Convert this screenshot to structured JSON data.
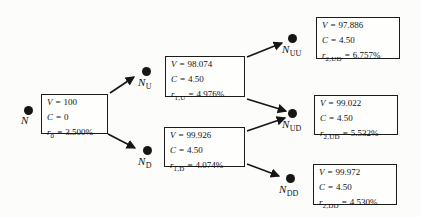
{
  "figure": {
    "eq": "=",
    "ink_color": "#161616",
    "background": "#fcfcfa"
  },
  "nodes": [
    {
      "id": "N",
      "label_main": "N",
      "label_sub": "",
      "box": {
        "rows": [
          {
            "var": "V",
            "sub": "",
            "value": "100"
          },
          {
            "var": "C",
            "sub": "",
            "value": "0"
          },
          {
            "var": "r",
            "sub": "0",
            "value": "3.500%"
          }
        ]
      }
    },
    {
      "id": "NU",
      "label_main": "N",
      "label_sub": "U",
      "box": {
        "rows": [
          {
            "var": "V",
            "sub": "",
            "value": "98.074"
          },
          {
            "var": "C",
            "sub": "",
            "value": "4.50"
          },
          {
            "var": "r",
            "sub": "1,U",
            "value": "4.976%"
          }
        ]
      }
    },
    {
      "id": "ND",
      "label_main": "N",
      "label_sub": "D",
      "box": {
        "rows": [
          {
            "var": "V",
            "sub": "",
            "value": "99.926"
          },
          {
            "var": "C",
            "sub": "",
            "value": "4.50"
          },
          {
            "var": "r",
            "sub": "1,D",
            "value": "4.074%"
          }
        ]
      }
    },
    {
      "id": "NUU",
      "label_main": "N",
      "label_sub": "UU",
      "box": {
        "rows": [
          {
            "var": "V",
            "sub": "",
            "value": "97.886"
          },
          {
            "var": "C",
            "sub": "",
            "value": "4.50"
          },
          {
            "var": "r",
            "sub": "2,UD",
            "value": "6.757%"
          }
        ]
      }
    },
    {
      "id": "NUD",
      "label_main": "N",
      "label_sub": "UD",
      "box": {
        "rows": [
          {
            "var": "V",
            "sub": "",
            "value": "99.022"
          },
          {
            "var": "C",
            "sub": "",
            "value": "4.50"
          },
          {
            "var": "r",
            "sub": "2,UD",
            "value": "5.532%"
          }
        ]
      }
    },
    {
      "id": "NDD",
      "label_main": "N",
      "label_sub": "DD",
      "box": {
        "rows": [
          {
            "var": "V",
            "sub": "",
            "value": "99.972"
          },
          {
            "var": "C",
            "sub": "",
            "value": "4.50"
          },
          {
            "var": "r",
            "sub": "2,DD",
            "value": "4.530%"
          }
        ]
      }
    }
  ]
}
